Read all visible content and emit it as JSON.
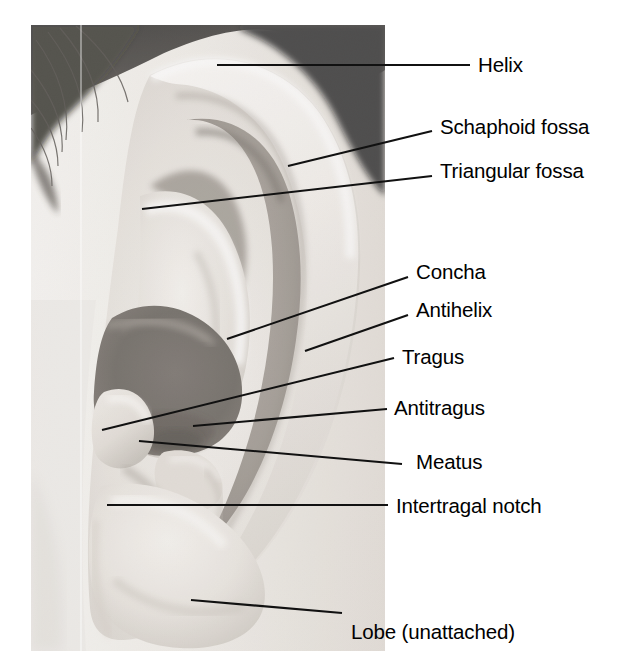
{
  "figure": {
    "kind": "labeled-photograph",
    "background_color": "#ffffff",
    "label_color": "#000000",
    "leader_color": "#111111"
  },
  "photo": {
    "name": "ear-photograph",
    "style": "black-and-white halftone photograph",
    "frame": {
      "x": 31,
      "y": 25,
      "width": 354,
      "height": 626
    },
    "tones": {
      "hair_dark": "#14120f",
      "hair_mid": "#3a352f",
      "skin_light": "#ebe7e1",
      "skin_mid": "#c9c3bb",
      "skin_highlight": "#f6f3ee",
      "concha_shadow": "#5f5952",
      "cavity_dark": "#474039"
    }
  },
  "labels": [
    {
      "id": "helix",
      "text": "Helix",
      "text_x": 478,
      "text_y": 55,
      "leader": {
        "x1": 217,
        "y1": 65,
        "x2": 470,
        "y2": 65
      }
    },
    {
      "id": "schaphoid-fossa",
      "text": "Schaphoid fossa",
      "text_x": 440,
      "text_y": 117,
      "leader": {
        "x1": 288,
        "y1": 166,
        "x2": 432,
        "y2": 131
      }
    },
    {
      "id": "triangular-fossa",
      "text": "Triangular fossa",
      "text_x": 440,
      "text_y": 161,
      "leader": {
        "x1": 142,
        "y1": 209,
        "x2": 432,
        "y2": 176
      }
    },
    {
      "id": "concha",
      "text": "Concha",
      "text_x": 416,
      "text_y": 262,
      "leader": {
        "x1": 227,
        "y1": 339,
        "x2": 408,
        "y2": 277
      }
    },
    {
      "id": "antihelix",
      "text": "Antihelix",
      "text_x": 416,
      "text_y": 300,
      "leader": {
        "x1": 305,
        "y1": 351,
        "x2": 408,
        "y2": 315
      }
    },
    {
      "id": "tragus",
      "text": "Tragus",
      "text_x": 402,
      "text_y": 347,
      "leader": {
        "x1": 102,
        "y1": 430,
        "x2": 394,
        "y2": 358
      }
    },
    {
      "id": "antitragus",
      "text": "Antitragus",
      "text_x": 394,
      "text_y": 398,
      "leader": {
        "x1": 193,
        "y1": 426,
        "x2": 387,
        "y2": 409
      }
    },
    {
      "id": "meatus",
      "text": "Meatus",
      "text_x": 416,
      "text_y": 452,
      "leader": {
        "x1": 139,
        "y1": 441,
        "x2": 402,
        "y2": 464
      }
    },
    {
      "id": "intertragal-notch",
      "text": "Intertragal notch",
      "text_x": 396,
      "text_y": 496,
      "leader": {
        "x1": 107,
        "y1": 505,
        "x2": 388,
        "y2": 505
      }
    },
    {
      "id": "lobe-unattached",
      "text": "Lobe (unattached)",
      "text_x": 351,
      "text_y": 622,
      "leader": {
        "x1": 191,
        "y1": 600,
        "x2": 342,
        "y2": 613
      }
    }
  ]
}
